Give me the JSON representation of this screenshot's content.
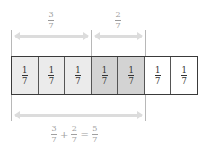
{
  "diagram": {
    "title_fraction_left": {
      "numerator": "3",
      "denominator": "7"
    },
    "title_fraction_right": {
      "numerator": "2",
      "denominator": "7"
    },
    "cells": [
      {
        "numerator": "1",
        "denominator": "7",
        "fill": "#ebebeb"
      },
      {
        "numerator": "1",
        "denominator": "7",
        "fill": "#ebebeb"
      },
      {
        "numerator": "1",
        "denominator": "7",
        "fill": "#ebebeb"
      },
      {
        "numerator": "1",
        "denominator": "7",
        "fill": "#d3d3d3"
      },
      {
        "numerator": "1",
        "denominator": "7",
        "fill": "#d3d3d3"
      },
      {
        "numerator": "1",
        "denominator": "7",
        "fill": "#ffffff"
      },
      {
        "numerator": "1",
        "denominator": "7",
        "fill": "#ffffff"
      }
    ],
    "equation": {
      "a": {
        "numerator": "3",
        "denominator": "7"
      },
      "plus": "+",
      "b": {
        "numerator": "2",
        "denominator": "7"
      },
      "equals": "=",
      "result": {
        "numerator": "5",
        "denominator": "7"
      }
    },
    "colors": {
      "first_part": "#ebebeb",
      "second_part": "#d3d3d3",
      "remaining": "#ffffff",
      "arrow": "#dcdcdc",
      "border": "#3a3a3a"
    }
  }
}
